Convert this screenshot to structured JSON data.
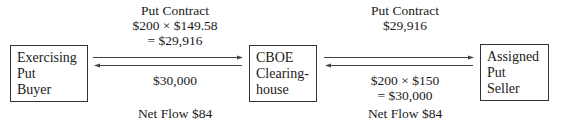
{
  "diagram": {
    "nodes": [
      {
        "id": "exercising-put-buyer",
        "lines": [
          "Exercising",
          "Put",
          "Buyer"
        ]
      },
      {
        "id": "cboe-clearinghouse",
        "lines": [
          "CBOE",
          "Clearing-",
          "house"
        ]
      },
      {
        "id": "assigned-put-seller",
        "lines": [
          "Assigned",
          "Put",
          "Seller"
        ]
      }
    ],
    "left_link": {
      "top_label": [
        "Put Contract",
        "$200 × $149.58",
        "= $29,916"
      ],
      "bottom_label": [
        "$30,000"
      ],
      "net_flow": "Net Flow $84",
      "top_arrow_direction": "right",
      "bottom_arrow_direction": "left"
    },
    "right_link": {
      "top_label": [
        "Put Contract",
        "$29,916"
      ],
      "bottom_label": [
        "$200 × $150",
        "= $30,000"
      ],
      "net_flow": "Net Flow $84",
      "top_arrow_direction": "right",
      "bottom_arrow_direction": "left"
    }
  }
}
